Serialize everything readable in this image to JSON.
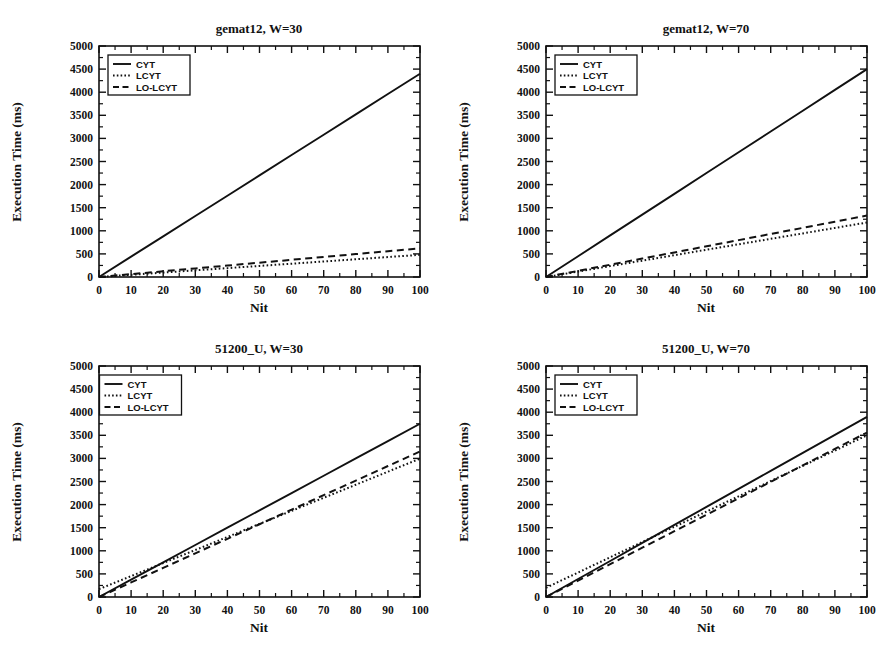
{
  "chart_data": [
    {
      "type": "line",
      "panel": "top-left",
      "title": "gemat12, W=30",
      "xlabel": "Nit",
      "ylabel": "Execution Time (ms)",
      "xlim": [
        0,
        100
      ],
      "ylim": [
        0,
        5000
      ],
      "xticks": [
        0,
        10,
        20,
        30,
        40,
        50,
        60,
        70,
        80,
        90,
        100
      ],
      "yticks": [
        0,
        500,
        1000,
        1500,
        2000,
        2500,
        3000,
        3500,
        4000,
        4500,
        5000
      ],
      "grid": false,
      "legend_position": "upper-left",
      "x": [
        0,
        10,
        20,
        30,
        40,
        50,
        60,
        70,
        80,
        90,
        100
      ],
      "series": [
        {
          "name": "CYT",
          "style": "solid",
          "values": [
            0,
            440,
            880,
            1320,
            1760,
            2200,
            2640,
            3080,
            3520,
            3960,
            4400
          ]
        },
        {
          "name": "LCYT",
          "style": "dotted",
          "values": [
            0,
            48,
            96,
            144,
            192,
            240,
            288,
            336,
            384,
            432,
            480
          ]
        },
        {
          "name": "LO-LCYT",
          "style": "dashed",
          "values": [
            0,
            62,
            124,
            186,
            248,
            310,
            372,
            434,
            496,
            558,
            620
          ]
        }
      ]
    },
    {
      "type": "line",
      "panel": "top-right",
      "title": "gemat12, W=70",
      "xlabel": "Nit",
      "ylabel": "Execution Time (ms)",
      "xlim": [
        0,
        100
      ],
      "ylim": [
        0,
        5000
      ],
      "xticks": [
        0,
        10,
        20,
        30,
        40,
        50,
        60,
        70,
        80,
        90,
        100
      ],
      "yticks": [
        0,
        500,
        1000,
        1500,
        2000,
        2500,
        3000,
        3500,
        4000,
        4500,
        5000
      ],
      "grid": false,
      "legend_position": "upper-left",
      "x": [
        0,
        10,
        20,
        30,
        40,
        50,
        60,
        70,
        80,
        90,
        100
      ],
      "series": [
        {
          "name": "CYT",
          "style": "solid",
          "values": [
            0,
            450,
            900,
            1350,
            1800,
            2250,
            2700,
            3150,
            3600,
            4050,
            4500
          ]
        },
        {
          "name": "LCYT",
          "style": "dotted",
          "values": [
            0,
            118,
            236,
            354,
            472,
            590,
            708,
            826,
            944,
            1062,
            1180
          ]
        },
        {
          "name": "LO-LCYT",
          "style": "dashed",
          "values": [
            0,
            133,
            266,
            399,
            532,
            665,
            798,
            931,
            1064,
            1197,
            1330
          ]
        }
      ]
    },
    {
      "type": "line",
      "panel": "bottom-left",
      "title": "51200_U, W=30",
      "xlabel": "Nit",
      "ylabel": "Execution Time (ms)",
      "xlim": [
        0,
        100
      ],
      "ylim": [
        0,
        5000
      ],
      "xticks": [
        0,
        10,
        20,
        30,
        40,
        50,
        60,
        70,
        80,
        90,
        100
      ],
      "yticks": [
        0,
        500,
        1000,
        1500,
        2000,
        2500,
        3000,
        3500,
        4000,
        4500,
        5000
      ],
      "grid": false,
      "legend_position": "upper-left",
      "x": [
        0,
        10,
        20,
        30,
        40,
        50,
        60,
        70,
        80,
        90,
        100
      ],
      "series": [
        {
          "name": "CYT",
          "style": "solid",
          "values": [
            0,
            375,
            750,
            1125,
            1500,
            1875,
            2250,
            2625,
            3000,
            3375,
            3750
          ]
        },
        {
          "name": "LCYT",
          "style": "dotted",
          "values": [
            170,
            452,
            735,
            1017,
            1300,
            1582,
            1865,
            2147,
            2430,
            2712,
            2995
          ]
        },
        {
          "name": "LO-LCYT",
          "style": "dashed",
          "values": [
            0,
            315,
            630,
            945,
            1260,
            1575,
            1890,
            2205,
            2520,
            2835,
            3150
          ]
        }
      ]
    },
    {
      "type": "line",
      "panel": "bottom-right",
      "title": "51200_U, W=70",
      "xlabel": "Nit",
      "ylabel": "Execution Time (ms)",
      "xlim": [
        0,
        100
      ],
      "ylim": [
        0,
        5000
      ],
      "xticks": [
        0,
        10,
        20,
        30,
        40,
        50,
        60,
        70,
        80,
        90,
        100
      ],
      "yticks": [
        0,
        500,
        1000,
        1500,
        2000,
        2500,
        3000,
        3500,
        4000,
        4500,
        5000
      ],
      "grid": false,
      "legend_position": "upper-left",
      "x": [
        0,
        10,
        20,
        30,
        40,
        50,
        60,
        70,
        80,
        90,
        100
      ],
      "series": [
        {
          "name": "CYT",
          "style": "solid",
          "values": [
            0,
            390,
            780,
            1170,
            1560,
            1950,
            2340,
            2730,
            3120,
            3510,
            3900
          ]
        },
        {
          "name": "LCYT",
          "style": "dotted",
          "values": [
            200,
            530,
            860,
            1190,
            1520,
            1850,
            2180,
            2510,
            2840,
            3170,
            3500
          ]
        },
        {
          "name": "LO-LCYT",
          "style": "dashed",
          "values": [
            0,
            356,
            712,
            1068,
            1424,
            1780,
            2136,
            2492,
            2848,
            3204,
            3560
          ]
        }
      ]
    }
  ],
  "common": {
    "xlabel": "Nit",
    "ylabel": "Execution Time (ms)",
    "legend_entries": [
      "CYT",
      "LCYT",
      "LO-LCYT"
    ],
    "line_color": "#111111"
  }
}
